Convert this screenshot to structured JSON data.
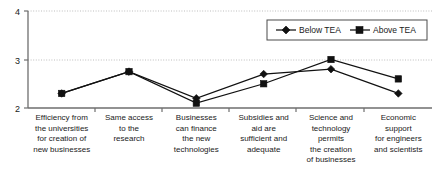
{
  "chart_data": {
    "type": "line",
    "title": "",
    "xlabel": "",
    "ylabel": "",
    "ylim": [
      2,
      4
    ],
    "yticks": [
      2,
      3,
      4
    ],
    "ytick_labels": [
      "2",
      "3",
      "4"
    ],
    "grid": true,
    "grid_axis": "y",
    "legend_position": "top-right",
    "categories": [
      "Efficiency from the universities for creation of new businesses",
      "Same access to the research",
      "Businesses can finance the new technologies",
      "Subsidies and aid are sufficient and adequate",
      "Science and technology permits the creation of businesses",
      "Economic support for engineers and scientists"
    ],
    "category_lines": [
      [
        "Efficiency from",
        "the universities",
        "for creation of",
        "new businesses"
      ],
      [
        "Same access",
        "to the",
        "research"
      ],
      [
        "Businesses",
        "can finance",
        "the new",
        "technologies"
      ],
      [
        "Subsidies and",
        "aid are",
        "sufficient and",
        "adequate"
      ],
      [
        "Science and",
        "technology",
        "permits",
        "the creation",
        "of businesses"
      ],
      [
        "Economic",
        "support",
        "for engineers",
        "and scientists"
      ]
    ],
    "series": [
      {
        "name": "Below TEA",
        "marker": "diamond",
        "color": "#111111",
        "values": [
          2.3,
          2.75,
          2.2,
          2.7,
          2.8,
          2.3
        ]
      },
      {
        "name": "Above TEA",
        "marker": "square",
        "color": "#111111",
        "values": [
          2.3,
          2.75,
          2.1,
          2.5,
          3.0,
          2.6
        ]
      }
    ]
  },
  "legend": {
    "items": [
      {
        "label": "Below TEA",
        "marker": "diamond"
      },
      {
        "label": "Above TEA",
        "marker": "square"
      }
    ]
  },
  "axis": {
    "y_top_label": "4",
    "y_mid_label": "3",
    "y_bottom_label": "2"
  }
}
